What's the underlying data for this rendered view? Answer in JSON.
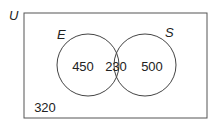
{
  "diagram": {
    "type": "venn",
    "universe_label": "U",
    "sets": [
      {
        "label": "E",
        "only_count": "450"
      },
      {
        "label": "S",
        "only_count": "500"
      }
    ],
    "intersection_count": "230",
    "outside_count": "320",
    "colors": {
      "stroke": "#444444",
      "background": "#ffffff",
      "text": "#222222"
    }
  }
}
